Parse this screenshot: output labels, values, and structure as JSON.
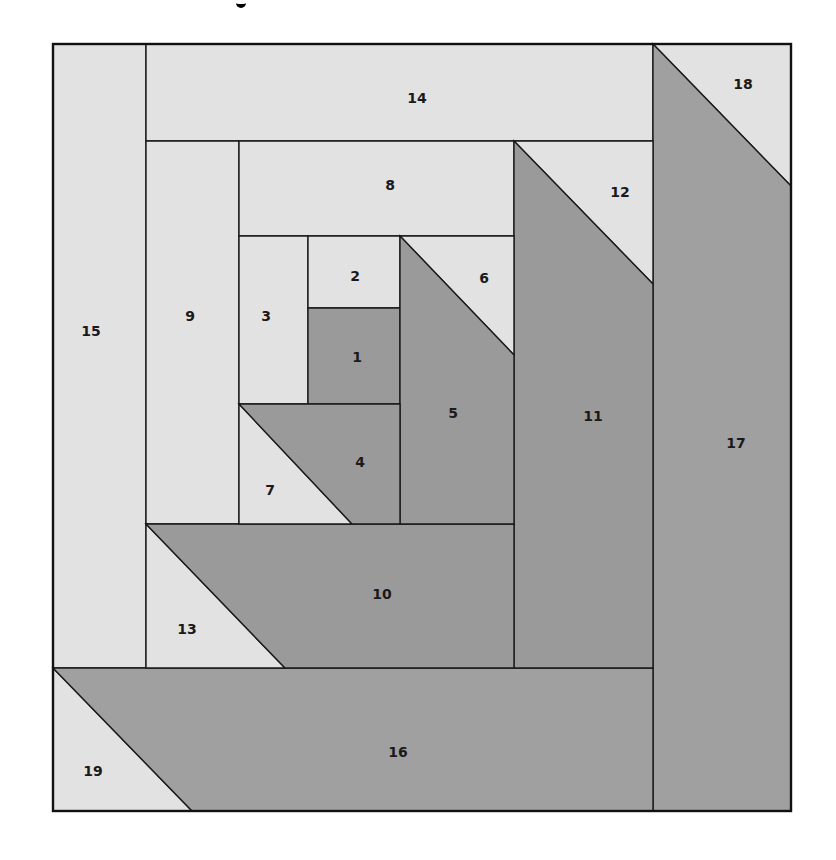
{
  "diagram": {
    "type": "quilt-block-piecing-diagram",
    "colors": {
      "light": "#e2e2e2",
      "dark": "#a0a0a0",
      "dark_alt": "#9a9a9a",
      "line": "#1a1a1a"
    },
    "frame": {
      "x": 53,
      "y": 44,
      "width": 738,
      "height": 767
    },
    "pieces": [
      {
        "id": "15",
        "fill": "light",
        "points": "53,44 146,44 146,668 53,668",
        "label": {
          "text": "15",
          "x": 91,
          "y": 331
        }
      },
      {
        "id": "14",
        "fill": "light",
        "points": "146,44 653,44 653,141 146,141",
        "label": {
          "text": "14",
          "x": 417,
          "y": 98
        }
      },
      {
        "id": "18",
        "fill": "light",
        "points": "653,44 791,44 791,186",
        "label": {
          "text": "18",
          "x": 743,
          "y": 84
        }
      },
      {
        "id": "17",
        "fill": "dark",
        "points": "653,44 791,186 791,811 653,811",
        "label": {
          "text": "17",
          "x": 736,
          "y": 443
        }
      },
      {
        "id": "19",
        "fill": "light",
        "points": "53,668 192,811 53,811",
        "label": {
          "text": "19",
          "x": 93,
          "y": 771
        }
      },
      {
        "id": "16",
        "fill": "dark",
        "points": "53,668 653,668 653,811 192,811",
        "label": {
          "text": "16",
          "x": 398,
          "y": 752
        }
      },
      {
        "id": "9",
        "fill": "light",
        "points": "146,141 239,141 239,524 146,524",
        "label": {
          "text": "9",
          "x": 190,
          "y": 316
        }
      },
      {
        "id": "8",
        "fill": "light",
        "points": "239,141 514,141 514,236 239,236",
        "label": {
          "text": "8",
          "x": 390,
          "y": 185
        }
      },
      {
        "id": "12",
        "fill": "light",
        "points": "514,141 653,141 653,284",
        "label": {
          "text": "12",
          "x": 620,
          "y": 192
        }
      },
      {
        "id": "11",
        "fill": "dark_alt",
        "points": "514,141 653,284 653,668 514,668",
        "label": {
          "text": "11",
          "x": 593,
          "y": 416
        }
      },
      {
        "id": "13",
        "fill": "light",
        "points": "146,524 285,668 146,668",
        "label": {
          "text": "13",
          "x": 187,
          "y": 629
        }
      },
      {
        "id": "10",
        "fill": "dark_alt",
        "points": "146,524 514,524 514,668 285,668",
        "label": {
          "text": "10",
          "x": 382,
          "y": 594
        }
      },
      {
        "id": "3",
        "fill": "light",
        "points": "239,236 308,236 308,404 239,404",
        "label": {
          "text": "3",
          "x": 266,
          "y": 316
        }
      },
      {
        "id": "2",
        "fill": "light",
        "points": "308,236 400,236 400,308 308,308",
        "label": {
          "text": "2",
          "x": 355,
          "y": 276
        }
      },
      {
        "id": "1",
        "fill": "dark_alt",
        "points": "308,308 400,308 400,404 308,404",
        "label": {
          "text": "1",
          "x": 357,
          "y": 357
        }
      },
      {
        "id": "6",
        "fill": "light",
        "points": "400,236 514,236 514,355",
        "label": {
          "text": "6",
          "x": 484,
          "y": 278
        }
      },
      {
        "id": "5",
        "fill": "dark_alt",
        "points": "400,236 514,355 514,524 400,524",
        "label": {
          "text": "5",
          "x": 453,
          "y": 413
        }
      },
      {
        "id": "7",
        "fill": "light",
        "points": "239,404 352,524 239,524",
        "label": {
          "text": "7",
          "x": 270,
          "y": 490
        }
      },
      {
        "id": "4",
        "fill": "dark_alt",
        "points": "239,404 400,404 400,524 352,524",
        "label": {
          "text": "4",
          "x": 360,
          "y": 462
        }
      }
    ]
  }
}
